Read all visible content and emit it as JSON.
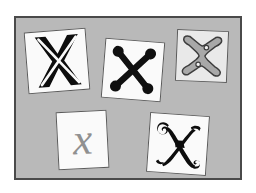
{
  "panel": {
    "background_color": "#b9b9b9",
    "border_color": "#4a4a4a",
    "page_background": "#ffffff"
  },
  "cards": [
    {
      "id": "card-1",
      "glyph": "X",
      "style_name": "bold-outlined-x",
      "description": "Bold black X with thin white outline stroke through the strokes",
      "fill_color": "#0d0d0d",
      "accent_color": "#fafafa",
      "card_color": "#fafafa",
      "border_color": "#5a5a5a",
      "rotation_deg": -4.5
    },
    {
      "id": "card-2",
      "glyph": "X",
      "style_name": "ball-terminal-x",
      "description": "Black X with round ball terminals at all four endpoints",
      "fill_color": "#101010",
      "accent_color": "#101010",
      "card_color": "#fafafa",
      "border_color": "#5a5a5a",
      "rotation_deg": 4.5
    },
    {
      "id": "card-3",
      "glyph": "X",
      "style_name": "gray-outlined-slab-x",
      "description": "Gray filled slab X with dark outline and notched waist",
      "fill_color": "#a8a8a8",
      "accent_color": "#3d3d3d",
      "card_color": "#e9e9e9",
      "border_color": "#5a5a5a",
      "rotation_deg": 2.5
    },
    {
      "id": "card-4",
      "glyph": "x",
      "style_name": "gray-italic-script-x",
      "description": "Medium gray italic serif lowercase x",
      "fill_color": "#909090",
      "accent_color": "#909090",
      "card_color": "#fafafa",
      "border_color": "#5a5a5a",
      "rotation_deg": -3
    },
    {
      "id": "card-5",
      "glyph": "X",
      "style_name": "ornate-calligraphic-x",
      "description": "Ornate black calligraphic X with curled swash terminals",
      "fill_color": "#0d0d0d",
      "accent_color": "#0d0d0d",
      "card_color": "#fafafa",
      "border_color": "#5a5a5a",
      "rotation_deg": 4
    }
  ]
}
